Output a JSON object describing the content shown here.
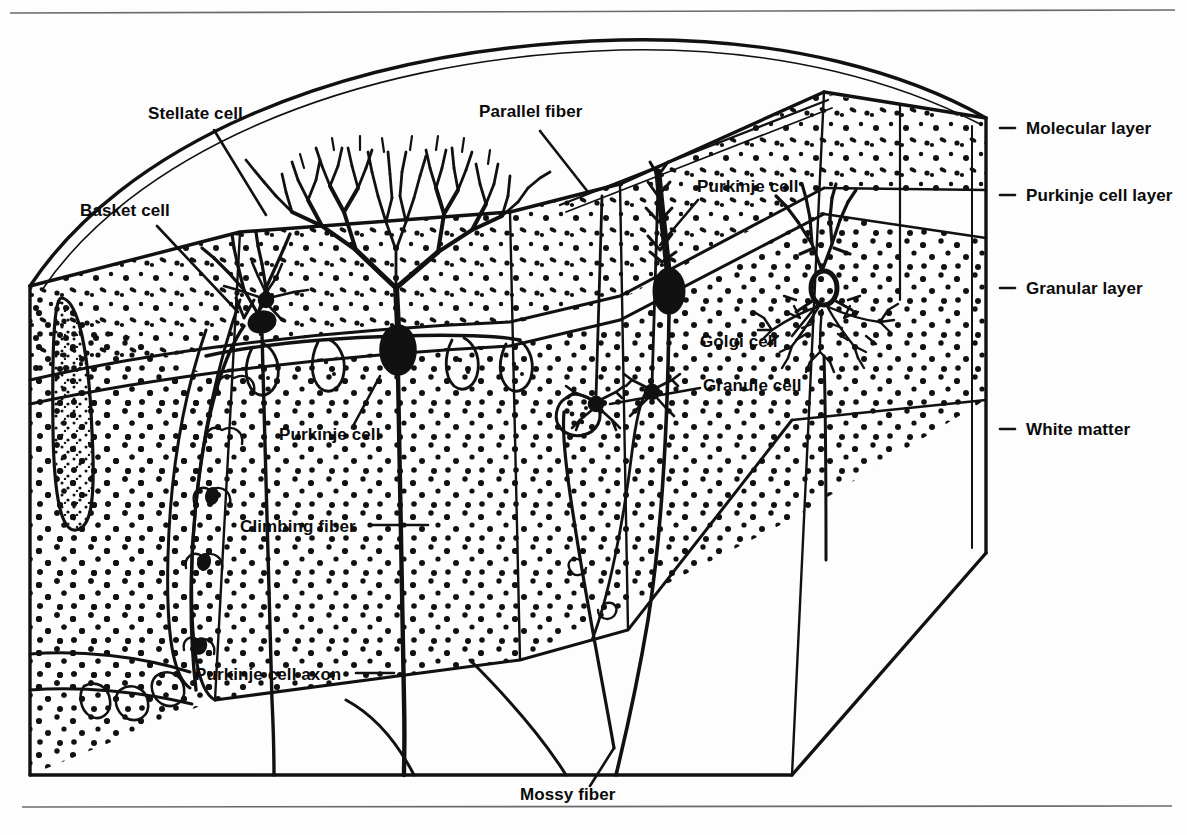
{
  "figure": {
    "background_color": "#fdfdfd",
    "ink_color": "#111111",
    "rule_color": "#6a6a6a"
  },
  "layer_labels": [
    {
      "id": "molecular-layer",
      "text": "Molecular layer",
      "x": 1030,
      "y": 133
    },
    {
      "id": "purkinje-cell-layer",
      "text": "Purkinje cell layer",
      "x": 1030,
      "y": 200
    },
    {
      "id": "granular-layer",
      "text": "Granular layer",
      "x": 1030,
      "y": 293
    },
    {
      "id": "white-matter",
      "text": "White matter",
      "x": 1030,
      "y": 434
    }
  ],
  "structure_labels": [
    {
      "id": "stellate-cell",
      "text": "Stellate cell",
      "x": 148,
      "y": 119,
      "anchor": "start"
    },
    {
      "id": "basket-cell",
      "text": "Basket cell",
      "x": 80,
      "y": 216,
      "anchor": "start"
    },
    {
      "id": "parallel-fiber",
      "text": "Parallel fiber",
      "x": 479,
      "y": 117,
      "anchor": "start"
    },
    {
      "id": "purkinje-cell-right",
      "text": "Purkinje cell",
      "x": 697,
      "y": 192,
      "anchor": "start"
    },
    {
      "id": "golgi-cell",
      "text": "Golgi cell",
      "x": 700,
      "y": 341,
      "anchor": "start"
    },
    {
      "id": "granule-cell",
      "text": "Granule cell",
      "x": 703,
      "y": 385,
      "anchor": "start"
    },
    {
      "id": "purkinje-cell-left",
      "text": "Purkinje cell",
      "x": 279,
      "y": 440,
      "anchor": "start"
    },
    {
      "id": "climbing-fiber",
      "text": "Climbing fiber",
      "x": 240,
      "y": 531,
      "anchor": "start"
    },
    {
      "id": "purkinje-cell-axon",
      "text": "Purkinje cell axon",
      "x": 195,
      "y": 679,
      "anchor": "start"
    },
    {
      "id": "mossy-fiber",
      "text": "Mossy fiber",
      "x": 520,
      "y": 797,
      "anchor": "start"
    }
  ],
  "layer_tick_marks": [
    {
      "id": "tick-molecular",
      "x1": 1000,
      "y1": 128,
      "x2": 1014,
      "y2": 128
    },
    {
      "id": "tick-purkinje",
      "x1": 1000,
      "y1": 195,
      "x2": 1014,
      "y2": 195
    },
    {
      "id": "tick-granular",
      "x1": 1000,
      "y1": 288,
      "x2": 1014,
      "y2": 288
    },
    {
      "id": "tick-white-matter",
      "x1": 1000,
      "y1": 429,
      "x2": 1014,
      "y2": 429
    }
  ],
  "leader_lines": [
    {
      "id": "leader-stellate",
      "points": "212,131 263,213"
    },
    {
      "id": "leader-basket",
      "points": "155,226 236,310"
    },
    {
      "id": "leader-parallel-fiber",
      "points": "540,130 585,186"
    },
    {
      "id": "leader-purkinje-right",
      "points": "700,200 660,243"
    },
    {
      "id": "leader-golgi",
      "points": "790,338 818,306"
    },
    {
      "id": "leader-granule",
      "points": "700,390 612,404"
    },
    {
      "id": "leader-purkinje-left",
      "points": "352,430 377,373"
    },
    {
      "id": "leader-climbing-fiber",
      "points": "370,525 424,525"
    },
    {
      "id": "leader-purkinje-axon",
      "points": "357,673 392,673"
    },
    {
      "id": "leader-mossy-fiber",
      "points": "590,788 613,748"
    }
  ],
  "rules": [
    {
      "id": "top-rule",
      "x1": 10,
      "y1": 13,
      "x2": 1175,
      "y2": 10
    },
    {
      "id": "bottom-rule",
      "x1": 22,
      "y1": 807,
      "x2": 1172,
      "y2": 806
    }
  ],
  "block_outline": {
    "folium_arc": "M 30,286 C 150,120 430,32 700,38 C 840,42 930,80 985,118",
    "front_top_ridge": "M 30,286 L 238,233 L 508,213 L 615,186 L 822,94 L 985,118",
    "bottom_front": "M 30,775 L 790,775 L 985,553",
    "left_face": "M 30,286 L 30,775",
    "right_face": "M 985,118 L 985,553"
  },
  "layer_boundaries": {
    "purkinje_layer_front": "M 30,380 C 180,350 340,330 520,322 L 620,300 L 822,188",
    "granular_top_front": "M 30,400 C 180,372 340,352 520,344 L 620,322 L 822,212",
    "white_matter_front": "M 215,700 L 520,660 L 790,520 L 985,400"
  },
  "cells": {
    "purkinje_dendritic_tree": "fan-shaped arbor in molecular layer",
    "golgi_cell": "large soma in granular layer with dense axonal plexus",
    "granule_cells": "small somata with claw dendrites",
    "stellate_cell": "small neuron in outer molecular layer",
    "basket_cell": "neuron with descending pericellular baskets"
  }
}
